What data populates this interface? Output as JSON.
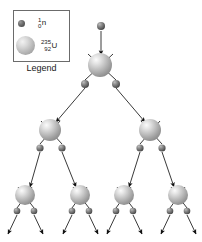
{
  "figure": {
    "background_color": "#ffffff"
  },
  "legend": {
    "caption": "Legend",
    "items": [
      {
        "icon": "neutron-sphere-icon",
        "kind": "neutron",
        "mass_number": "1",
        "atomic_number": "0",
        "symbol": "n",
        "color": "#6e6e6e",
        "radius": 3.5
      },
      {
        "icon": "uranium-sphere-icon",
        "kind": "uranium",
        "mass_number": "235",
        "atomic_number": "92",
        "symbol": "U",
        "color": "#c6c6c6",
        "radius": 9.5
      }
    ]
  },
  "chain": {
    "line_color": "#3a3a3a",
    "arrow_color": "#111111",
    "nuclei": [
      {
        "id": "u0",
        "generation": 1,
        "cx": 100,
        "cy": 65,
        "r": 12
      },
      {
        "id": "u1-l",
        "generation": 2,
        "cx": 50,
        "cy": 130,
        "r": 11
      },
      {
        "id": "u1-r",
        "generation": 2,
        "cx": 150,
        "cy": 130,
        "r": 11
      },
      {
        "id": "u2-a",
        "generation": 3,
        "cx": 25,
        "cy": 195,
        "r": 10
      },
      {
        "id": "u2-b",
        "generation": 3,
        "cx": 80,
        "cy": 195,
        "r": 10
      },
      {
        "id": "u2-c",
        "generation": 3,
        "cx": 124,
        "cy": 195,
        "r": 10
      },
      {
        "id": "u2-d",
        "generation": 3,
        "cx": 178,
        "cy": 195,
        "r": 10
      }
    ],
    "neutrons": [
      {
        "id": "n-in",
        "cx": 101,
        "cy": 26,
        "r": 4
      },
      {
        "id": "n-0-l",
        "cx": 85,
        "cy": 84,
        "r": 4
      },
      {
        "id": "n-0-r",
        "cx": 116,
        "cy": 84,
        "r": 4
      },
      {
        "id": "n-1l-l",
        "cx": 40,
        "cy": 148,
        "r": 3.6
      },
      {
        "id": "n-1l-r",
        "cx": 62,
        "cy": 148,
        "r": 3.6
      },
      {
        "id": "n-1r-l",
        "cx": 140,
        "cy": 148,
        "r": 3.6
      },
      {
        "id": "n-1r-r",
        "cx": 162,
        "cy": 148,
        "r": 3.6
      },
      {
        "id": "n-2a-l",
        "cx": 17,
        "cy": 211,
        "r": 3.3
      },
      {
        "id": "n-2a-r",
        "cx": 34,
        "cy": 211,
        "r": 3.3
      },
      {
        "id": "n-2b-l",
        "cx": 72,
        "cy": 211,
        "r": 3.3
      },
      {
        "id": "n-2b-r",
        "cx": 89,
        "cy": 211,
        "r": 3.3
      },
      {
        "id": "n-2c-l",
        "cx": 116,
        "cy": 211,
        "r": 3.3
      },
      {
        "id": "n-2c-r",
        "cx": 133,
        "cy": 211,
        "r": 3.3
      },
      {
        "id": "n-2d-l",
        "cx": 170,
        "cy": 211,
        "r": 3.3
      },
      {
        "id": "n-2d-r",
        "cx": 187,
        "cy": 211,
        "r": 3.3
      }
    ],
    "incoming_arrow": {
      "x1": 101,
      "y1": 31,
      "x2": 101,
      "y2": 55
    },
    "paths": [
      {
        "x1": 116,
        "y1": 80,
        "x2": 88,
        "y2": 54,
        "arrow": false
      },
      {
        "x1": 85,
        "y1": 80,
        "x2": 113,
        "y2": 54,
        "arrow": false
      },
      {
        "x1": 85,
        "y1": 88,
        "x2": 56,
        "y2": 122,
        "arrow": true
      },
      {
        "x1": 116,
        "y1": 88,
        "x2": 145,
        "y2": 122,
        "arrow": true
      },
      {
        "x1": 62,
        "y1": 144,
        "x2": 41,
        "y2": 121,
        "arrow": false
      },
      {
        "x1": 40,
        "y1": 144,
        "x2": 60,
        "y2": 121,
        "arrow": false
      },
      {
        "x1": 162,
        "y1": 144,
        "x2": 141,
        "y2": 121,
        "arrow": false
      },
      {
        "x1": 140,
        "y1": 144,
        "x2": 160,
        "y2": 121,
        "arrow": false
      },
      {
        "x1": 40,
        "y1": 152,
        "x2": 30,
        "y2": 187,
        "arrow": true
      },
      {
        "x1": 62,
        "y1": 152,
        "x2": 76,
        "y2": 187,
        "arrow": true
      },
      {
        "x1": 140,
        "y1": 152,
        "x2": 129,
        "y2": 187,
        "arrow": true
      },
      {
        "x1": 162,
        "y1": 152,
        "x2": 174,
        "y2": 187,
        "arrow": true
      },
      {
        "x1": 34,
        "y1": 208,
        "x2": 18,
        "y2": 187,
        "arrow": false
      },
      {
        "x1": 17,
        "y1": 208,
        "x2": 32,
        "y2": 187,
        "arrow": false
      },
      {
        "x1": 89,
        "y1": 208,
        "x2": 73,
        "y2": 187,
        "arrow": false
      },
      {
        "x1": 72,
        "y1": 208,
        "x2": 87,
        "y2": 187,
        "arrow": false
      },
      {
        "x1": 133,
        "y1": 208,
        "x2": 117,
        "y2": 187,
        "arrow": false
      },
      {
        "x1": 116,
        "y1": 208,
        "x2": 131,
        "y2": 187,
        "arrow": false
      },
      {
        "x1": 187,
        "y1": 208,
        "x2": 171,
        "y2": 187,
        "arrow": false
      },
      {
        "x1": 170,
        "y1": 208,
        "x2": 185,
        "y2": 187,
        "arrow": false
      },
      {
        "x1": 17,
        "y1": 215,
        "x2": 8,
        "y2": 234,
        "arrow": true
      },
      {
        "x1": 34,
        "y1": 215,
        "x2": 43,
        "y2": 234,
        "arrow": true
      },
      {
        "x1": 72,
        "y1": 215,
        "x2": 63,
        "y2": 234,
        "arrow": true
      },
      {
        "x1": 89,
        "y1": 215,
        "x2": 98,
        "y2": 234,
        "arrow": true
      },
      {
        "x1": 116,
        "y1": 215,
        "x2": 107,
        "y2": 234,
        "arrow": true
      },
      {
        "x1": 133,
        "y1": 215,
        "x2": 142,
        "y2": 234,
        "arrow": true
      },
      {
        "x1": 170,
        "y1": 215,
        "x2": 161,
        "y2": 234,
        "arrow": true
      },
      {
        "x1": 187,
        "y1": 215,
        "x2": 196,
        "y2": 234,
        "arrow": true
      }
    ]
  }
}
